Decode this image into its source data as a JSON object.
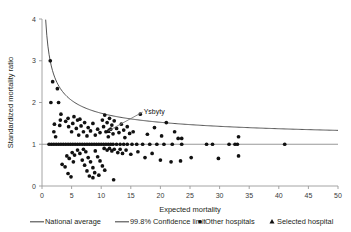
{
  "chart_data": {
    "type": "scatter",
    "title": "",
    "xlabel": "Expected mortality",
    "ylabel": "Standardized mortality ratio",
    "xlim": [
      0,
      50
    ],
    "ylim": [
      0,
      4
    ],
    "xticks": [
      0,
      5,
      10,
      15,
      20,
      25,
      30,
      35,
      40,
      45,
      50
    ],
    "yticks": [
      0,
      1,
      2,
      3,
      4
    ],
    "grid": false,
    "legend_position": "bottom",
    "national_average": 1.0,
    "confidence_level_label": "99.8%",
    "annotation": {
      "label": "Ysbyty",
      "target_x": 11.2,
      "target_y": 1.32,
      "label_x": 17.0,
      "label_y": 1.77
    },
    "series": [
      {
        "name": "Other hospitals",
        "marker": "circle",
        "color": "#111111",
        "points": [
          [
            1.4,
            3.0
          ],
          [
            1.8,
            2.5
          ],
          [
            1.5,
            2.0
          ],
          [
            2.8,
            2.0
          ],
          [
            2.6,
            2.33
          ],
          [
            3.2,
            1.72
          ],
          [
            3.1,
            1.58
          ],
          [
            3.0,
            1.45
          ],
          [
            2.1,
            1.48
          ],
          [
            2.0,
            1.3
          ],
          [
            2.3,
            1.18
          ],
          [
            1.2,
            1.0
          ],
          [
            1.6,
            1.0
          ],
          [
            2.0,
            1.0
          ],
          [
            2.4,
            1.0
          ],
          [
            2.8,
            1.0
          ],
          [
            3.2,
            1.0
          ],
          [
            3.6,
            1.0
          ],
          [
            4.0,
            1.0
          ],
          [
            4.4,
            1.0
          ],
          [
            4.8,
            1.0
          ],
          [
            5.2,
            1.0
          ],
          [
            5.6,
            1.0
          ],
          [
            6.0,
            1.0
          ],
          [
            6.4,
            1.0
          ],
          [
            6.8,
            1.0
          ],
          [
            7.2,
            1.0
          ],
          [
            7.6,
            1.0
          ],
          [
            8.0,
            1.0
          ],
          [
            8.4,
            1.0
          ],
          [
            8.8,
            1.0
          ],
          [
            9.2,
            1.0
          ],
          [
            9.6,
            1.0
          ],
          [
            10.0,
            1.0
          ],
          [
            10.4,
            1.0
          ],
          [
            10.8,
            1.0
          ],
          [
            11.2,
            1.0
          ],
          [
            11.6,
            1.0
          ],
          [
            12.0,
            1.0
          ],
          [
            12.6,
            1.0
          ],
          [
            13.2,
            1.0
          ],
          [
            13.8,
            1.0
          ],
          [
            14.4,
            1.0
          ],
          [
            15.2,
            1.0
          ],
          [
            16.0,
            1.0
          ],
          [
            17.0,
            1.0
          ],
          [
            18.2,
            1.0
          ],
          [
            19.4,
            1.0
          ],
          [
            20.6,
            1.0
          ],
          [
            22.0,
            1.0
          ],
          [
            23.6,
            1.0
          ],
          [
            27.8,
            1.0
          ],
          [
            28.8,
            1.0
          ],
          [
            31.6,
            1.0
          ],
          [
            32.6,
            1.0
          ],
          [
            33.0,
            1.0
          ],
          [
            41.0,
            1.0
          ],
          [
            3.4,
            0.52
          ],
          [
            3.9,
            0.46
          ],
          [
            4.4,
            0.3
          ],
          [
            4.9,
            0.22
          ],
          [
            5.3,
            0.58
          ],
          [
            4.2,
            0.72
          ],
          [
            4.6,
            0.66
          ],
          [
            5.1,
            0.8
          ],
          [
            5.5,
            0.74
          ],
          [
            6.0,
            0.86
          ],
          [
            6.4,
            0.78
          ],
          [
            6.8,
            0.62
          ],
          [
            7.2,
            0.5
          ],
          [
            7.6,
            0.36
          ],
          [
            8.0,
            0.24
          ],
          [
            8.6,
            0.2
          ],
          [
            7.0,
            0.88
          ],
          [
            7.4,
            0.82
          ],
          [
            7.8,
            0.68
          ],
          [
            8.2,
            0.58
          ],
          [
            8.6,
            0.44
          ],
          [
            9.0,
            0.84
          ],
          [
            9.4,
            0.7
          ],
          [
            9.8,
            0.6
          ],
          [
            10.2,
            0.48
          ],
          [
            10.6,
            0.38
          ],
          [
            8.9,
            0.32
          ],
          [
            9.6,
            0.26
          ],
          [
            12.1,
            0.15
          ],
          [
            4.0,
            1.55
          ],
          [
            4.5,
            1.42
          ],
          [
            4.4,
            1.62
          ],
          [
            5.0,
            1.3
          ],
          [
            5.2,
            1.5
          ],
          [
            5.4,
            1.66
          ],
          [
            5.8,
            1.38
          ],
          [
            6.0,
            1.58
          ],
          [
            6.2,
            1.22
          ],
          [
            6.6,
            1.44
          ],
          [
            6.4,
            1.6
          ],
          [
            7.0,
            1.3
          ],
          [
            7.2,
            1.52
          ],
          [
            7.6,
            1.2
          ],
          [
            7.8,
            1.4
          ],
          [
            8.2,
            1.32
          ],
          [
            8.6,
            1.5
          ],
          [
            9.0,
            1.22
          ],
          [
            9.4,
            1.36
          ],
          [
            9.8,
            1.28
          ],
          [
            10.2,
            1.58
          ],
          [
            10.4,
            1.42
          ],
          [
            10.6,
            1.7
          ],
          [
            10.8,
            1.3
          ],
          [
            11.0,
            1.52
          ],
          [
            11.2,
            1.18
          ],
          [
            11.4,
            1.62
          ],
          [
            11.6,
            1.36
          ],
          [
            11.8,
            1.46
          ],
          [
            12.0,
            1.25
          ],
          [
            12.2,
            1.56
          ],
          [
            12.6,
            1.38
          ],
          [
            13.0,
            1.28
          ],
          [
            13.4,
            1.48
          ],
          [
            13.8,
            1.34
          ],
          [
            14.0,
            1.16
          ],
          [
            14.4,
            1.42
          ],
          [
            14.8,
            1.26
          ],
          [
            15.4,
            1.3
          ],
          [
            10.5,
            0.9
          ],
          [
            11.0,
            0.86
          ],
          [
            11.4,
            0.9
          ],
          [
            11.8,
            0.84
          ],
          [
            12.2,
            0.88
          ],
          [
            12.8,
            0.8
          ],
          [
            13.2,
            0.88
          ],
          [
            13.6,
            0.78
          ],
          [
            14.2,
            0.86
          ],
          [
            15.0,
            0.76
          ],
          [
            16.2,
            0.82
          ],
          [
            17.4,
            0.68
          ],
          [
            18.6,
            0.78
          ],
          [
            20.0,
            0.62
          ],
          [
            21.8,
            0.58
          ],
          [
            23.4,
            0.6
          ],
          [
            25.2,
            0.68
          ],
          [
            29.8,
            0.66
          ],
          [
            33.2,
            0.72
          ],
          [
            16.6,
            1.72
          ],
          [
            17.8,
            1.24
          ],
          [
            19.0,
            1.4
          ],
          [
            20.2,
            1.2
          ],
          [
            21.0,
            1.52
          ],
          [
            22.4,
            1.3
          ],
          [
            23.0,
            1.14
          ],
          [
            33.2,
            1.18
          ],
          [
            23.6,
            1.14
          ]
        ]
      },
      {
        "name": "Selected hospital",
        "marker": "triangle",
        "color": "#111111",
        "points": [
          [
            11.2,
            1.32
          ]
        ]
      }
    ]
  },
  "legend": {
    "items": [
      {
        "label": "National average",
        "marker": "line"
      },
      {
        "label": "99.8% Confidence limit",
        "marker": "line"
      },
      {
        "label": "Other hospitals",
        "marker": "circle"
      },
      {
        "label": "Selected hospital",
        "marker": "triangle"
      }
    ]
  }
}
